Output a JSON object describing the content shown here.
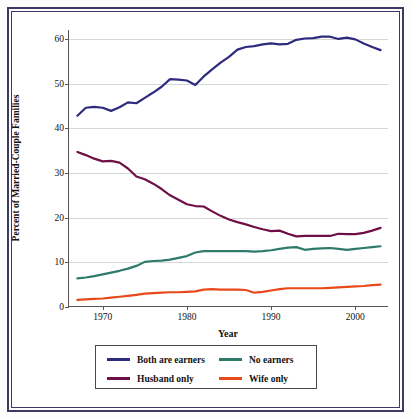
{
  "frame": {
    "border_color": "#3b3a66",
    "background": "#ffffff"
  },
  "chart_data": {
    "type": "line",
    "title": "",
    "subtitle": "",
    "xlabel": "Year",
    "ylabel": "Percent of Married-Couple Families",
    "xlim": [
      1966,
      2004
    ],
    "ylim": [
      0,
      62
    ],
    "xticks": [
      1970,
      1980,
      1990,
      2000
    ],
    "xtick_labels": [
      "1970",
      "1980",
      "1990",
      "2000"
    ],
    "yticks": [
      0,
      10,
      20,
      30,
      40,
      50,
      60
    ],
    "ytick_labels": [
      "0",
      "10",
      "20",
      "30",
      "40",
      "50",
      "60"
    ],
    "grid": "horizontal",
    "legend_position": "below-center",
    "x": [
      1967,
      1968,
      1969,
      1970,
      1971,
      1972,
      1973,
      1974,
      1975,
      1976,
      1977,
      1978,
      1979,
      1980,
      1981,
      1982,
      1983,
      1984,
      1985,
      1986,
      1987,
      1988,
      1989,
      1990,
      1991,
      1992,
      1993,
      1994,
      1995,
      1996,
      1997,
      1998,
      1999,
      2000,
      2001,
      2002,
      2003
    ],
    "series": [
      {
        "name": "Both are earners",
        "color": "#2e2b7f",
        "values": [
          42.8,
          44.6,
          44.8,
          44.6,
          43.9,
          44.7,
          45.8,
          45.6,
          46.8,
          48.0,
          49.3,
          51.0,
          50.9,
          50.7,
          49.7,
          51.6,
          53.2,
          54.7,
          56.0,
          57.6,
          58.2,
          58.4,
          58.8,
          59.0,
          58.8,
          58.9,
          59.8,
          60.1,
          60.2,
          60.5,
          60.5,
          60.0,
          60.3,
          59.9,
          59.0,
          58.2,
          57.5
        ]
      },
      {
        "name": "Husband only",
        "color": "#6e1046",
        "values": [
          34.7,
          34.0,
          33.2,
          32.6,
          32.7,
          32.3,
          31.0,
          29.2,
          28.6,
          27.6,
          26.4,
          25.0,
          24.0,
          23.0,
          22.6,
          22.5,
          21.4,
          20.4,
          19.6,
          19.0,
          18.5,
          17.9,
          17.4,
          17.0,
          17.1,
          16.4,
          15.8,
          15.9,
          15.9,
          15.9,
          15.9,
          16.4,
          16.3,
          16.3,
          16.6,
          17.1,
          17.7
        ]
      },
      {
        "name": "No earners",
        "color": "#2f7b6a",
        "values": [
          6.4,
          6.6,
          6.9,
          7.3,
          7.7,
          8.1,
          8.6,
          9.2,
          10.1,
          10.3,
          10.4,
          10.6,
          11.0,
          11.4,
          12.2,
          12.5,
          12.5,
          12.5,
          12.5,
          12.5,
          12.5,
          12.4,
          12.5,
          12.7,
          13.0,
          13.3,
          13.4,
          12.8,
          13.0,
          13.1,
          13.2,
          13.0,
          12.8,
          13.0,
          13.2,
          13.4,
          13.6
        ]
      },
      {
        "name": "Wife only",
        "color": "#e8491b",
        "values": [
          1.6,
          1.7,
          1.8,
          1.9,
          2.1,
          2.3,
          2.5,
          2.7,
          3.0,
          3.1,
          3.2,
          3.3,
          3.3,
          3.4,
          3.5,
          3.9,
          4.0,
          3.9,
          3.9,
          3.9,
          3.8,
          3.2,
          3.4,
          3.7,
          4.0,
          4.2,
          4.2,
          4.2,
          4.2,
          4.2,
          4.3,
          4.4,
          4.5,
          4.6,
          4.7,
          4.9,
          5.0
        ]
      }
    ]
  },
  "legend": {
    "items": [
      {
        "label": "Both are earners",
        "color": "#2e2b7f"
      },
      {
        "label": "No earners",
        "color": "#2f7b6a"
      },
      {
        "label": "Husband only",
        "color": "#6e1046"
      },
      {
        "label": "Wife only",
        "color": "#e8491b"
      }
    ]
  }
}
